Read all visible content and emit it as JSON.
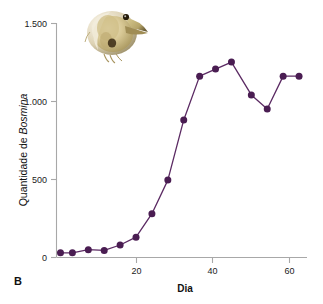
{
  "panel": {
    "label": "B"
  },
  "colors": {
    "series": "#5b2a63",
    "marker": "#4a1d52",
    "axis": "#a8a8a8",
    "text": "#111111",
    "background": "#ffffff"
  },
  "photo": {
    "name": "bosmina-photograph",
    "caption": "Bosmina",
    "alt": "Fotografia de um microcrustáceo Bosmina"
  },
  "chart_data": {
    "type": "line",
    "title": "",
    "xlabel": "Dia",
    "ylabel_plain": "Quantidade de ",
    "ylabel_italic": "Bosmina",
    "ylabel_full": "Quantidade de Bosmina",
    "xlim": [
      0,
      63
    ],
    "ylim": [
      0,
      1500
    ],
    "grid": false,
    "legend": "none",
    "xticks": [
      20,
      40,
      60
    ],
    "xtick_labels": [
      "20",
      "40",
      "60"
    ],
    "yticks": [
      0,
      500,
      1000,
      1500
    ],
    "ytick_labels": [
      "0",
      "500",
      "1.000",
      "1.500"
    ],
    "x": [
      1,
      4,
      8,
      12,
      16,
      20,
      24,
      28,
      32,
      36,
      40,
      44,
      49,
      53,
      57,
      61
    ],
    "values": [
      30,
      30,
      50,
      45,
      80,
      130,
      280,
      495,
      880,
      1160,
      1205,
      1250,
      1040,
      950,
      1160,
      1160
    ],
    "series": [
      {
        "name": "Quantidade de Bosmina",
        "x": [
          1,
          4,
          8,
          12,
          16,
          20,
          24,
          28,
          32,
          36,
          40,
          44,
          49,
          53,
          57,
          61
        ],
        "values": [
          30,
          30,
          50,
          45,
          80,
          130,
          280,
          495,
          880,
          1160,
          1205,
          1250,
          1040,
          950,
          1160,
          1160
        ]
      }
    ]
  }
}
